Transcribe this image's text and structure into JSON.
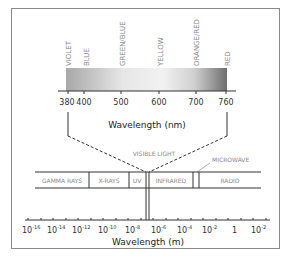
{
  "visible_spectrum": {
    "colors": [
      "VIOLET",
      "BLUE",
      "GREEN/BLUE",
      "YELLOW",
      "ORANGE/RED",
      "RED"
    ],
    "ticks": [
      "380",
      "400",
      "500",
      "600",
      "700",
      "760"
    ],
    "axis_label": "Wavelength (nm)"
  },
  "callout_label": "VISIBLE LIGHT",
  "microwave_label": "MICROWAVE",
  "bands": [
    "GAMMA RAYS",
    "X-RAYS",
    "UV",
    "INFRARED",
    "RADIO"
  ],
  "em_axis": {
    "ticks": [
      {
        "base": "10",
        "exp": "-16"
      },
      {
        "base": "10",
        "exp": "-14"
      },
      {
        "base": "10",
        "exp": "-12"
      },
      {
        "base": "10",
        "exp": "-10"
      },
      {
        "base": "10",
        "exp": "-8"
      },
      {
        "base": "10",
        "exp": "-6"
      },
      {
        "base": "10",
        "exp": "-4"
      },
      {
        "base": "10",
        "exp": "-2"
      },
      {
        "base": "1",
        "exp": ""
      },
      {
        "base": "10",
        "exp": "-2"
      }
    ],
    "axis_label": "Wavelength (m)"
  }
}
